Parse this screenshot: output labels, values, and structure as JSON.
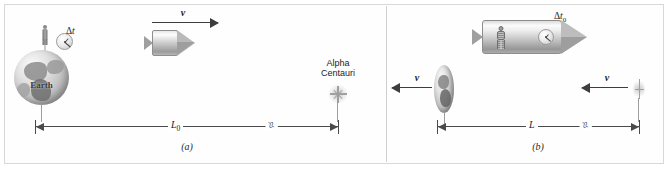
{
  "figure": {
    "background": "#ffffff",
    "border_color": "#d8d8d8",
    "ink_color": "#3d3d3d"
  },
  "panel_a": {
    "caption": "(a)",
    "earth_label": "Earth",
    "clock_label_delta": "Δ",
    "clock_label_var": "t",
    "velocity_label": "v",
    "velocity_direction": "right",
    "destination_line_1": "Alpha",
    "destination_line_2": "Centauri",
    "distance_label_var": "L",
    "distance_label_sub": "0",
    "break_symbol": "≈",
    "objects": [
      "earth-globe",
      "observer-person",
      "earth-clock",
      "rocket-contracted",
      "velocity-arrow",
      "alpha-centauri-star",
      "distance-dimension-line"
    ]
  },
  "panel_b": {
    "caption": "(b)",
    "clock_label_delta": "Δ",
    "clock_label_var": "t",
    "clock_label_sub": "0",
    "velocity_label_earth": "v",
    "velocity_label_star": "v",
    "velocity_direction": "left",
    "distance_label_var": "L",
    "break_symbol": "≈",
    "objects": [
      "rocket-full-length",
      "astronaut",
      "rocket-clock-porthole",
      "earth-contracted",
      "velocity-arrow-earth",
      "velocity-arrow-star",
      "alpha-centauri-star-contracted",
      "distance-dimension-line"
    ]
  }
}
